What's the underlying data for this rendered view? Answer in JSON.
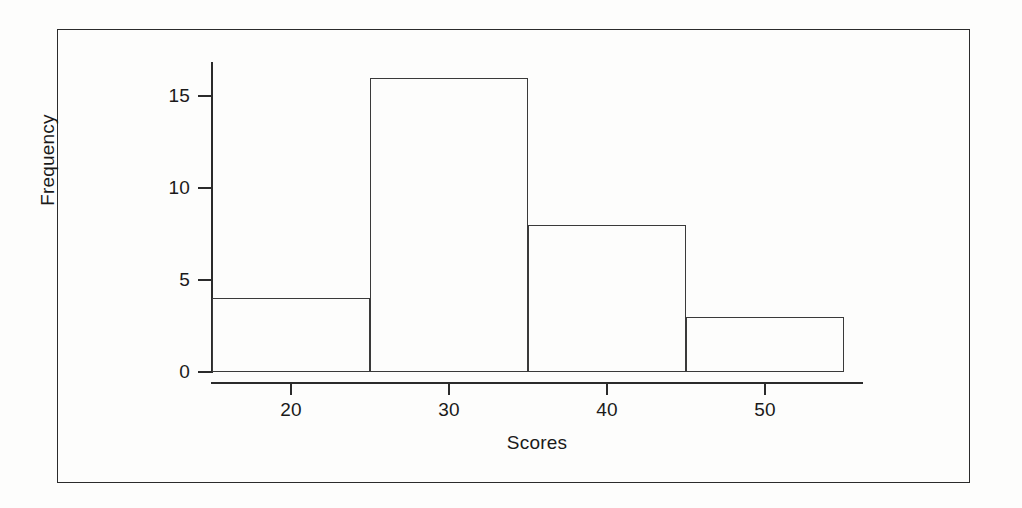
{
  "figure": {
    "border_color": "#2b2b2b",
    "background_color": "#fdfdfc"
  },
  "chart_data": {
    "type": "bar",
    "chart_subtype": "histogram",
    "title": "",
    "xlabel": "Scores",
    "ylabel": "Frequency",
    "xlim": [
      15,
      56.3
    ],
    "ylim": [
      0,
      17
    ],
    "grid": false,
    "legend": null,
    "bin_edges": [
      15,
      25,
      35,
      45,
      55
    ],
    "bin_width": 10,
    "categories": [
      "15-25",
      "25-35",
      "35-45",
      "45-55"
    ],
    "values": [
      4,
      16,
      8,
      3
    ],
    "bars": [
      {
        "label": "15-25",
        "x_start": 15,
        "x_end": 25,
        "value": 4
      },
      {
        "label": "25-35",
        "x_start": 25,
        "x_end": 35,
        "value": 16
      },
      {
        "label": "35-45",
        "x_start": 35,
        "x_end": 45,
        "value": 8
      },
      {
        "label": "45-55",
        "x_start": 45,
        "x_end": 55,
        "value": 3
      }
    ],
    "bar_fill": "none",
    "bar_edge_color": "#3a3a3a",
    "x_ticks": [
      20,
      30,
      40,
      50
    ],
    "x_tick_labels": [
      "20",
      "30",
      "40",
      "50"
    ],
    "y_ticks": [
      0,
      5,
      10,
      15
    ],
    "y_tick_labels": [
      "0",
      "5",
      "10",
      "15"
    ]
  }
}
